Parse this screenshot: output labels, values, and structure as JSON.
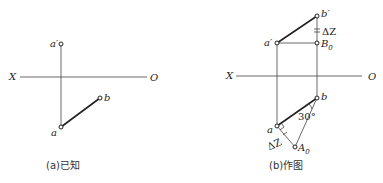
{
  "figure_a": {
    "caption": "(a)已知",
    "axis": {
      "left_label": "X",
      "right_label": "O"
    },
    "points": {
      "a_prime": "a′",
      "a": "a",
      "b": "b"
    }
  },
  "figure_b": {
    "caption": "(b)作图",
    "axis": {
      "left_label": "X",
      "right_label": "O"
    },
    "points": {
      "a_prime": "a′",
      "b_prime": "b′",
      "B0": "B",
      "B0_sub": "0",
      "a": "a",
      "b": "b",
      "A0": "A",
      "A0_sub": "0"
    },
    "delta_z_upper": "ΔZ",
    "delta_z_lower": "ΔZ",
    "angle": "30°"
  }
}
